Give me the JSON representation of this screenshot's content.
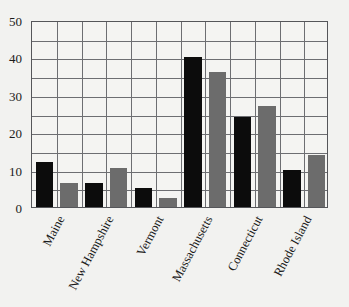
{
  "chart_data": {
    "type": "bar",
    "title": "",
    "subtitle": "",
    "xlabel": "",
    "ylabel": "",
    "categories": [
      "Maine",
      "New Hampshire",
      "Vermont",
      "Massachusetts",
      "Connecticut",
      "Rhode Island"
    ],
    "series": [
      {
        "name": "Series 1",
        "color": "#0c0c0c",
        "values": [
          12,
          6.5,
          5,
          40,
          24,
          10
        ]
      },
      {
        "name": "Series 2",
        "color": "#6c6c6c",
        "values": [
          6.5,
          10.5,
          2.5,
          36,
          27,
          14
        ]
      }
    ],
    "ylim": [
      0,
      50
    ],
    "ytick_labels": [
      "0",
      "10",
      "20",
      "30",
      "40",
      "50"
    ],
    "ytick_values": [
      0,
      10,
      20,
      30,
      40,
      50
    ],
    "gridlines_major_y": [
      0,
      5,
      10,
      15,
      20,
      25,
      30,
      35,
      40,
      45,
      50
    ],
    "grid": true,
    "legend": "none",
    "legend_position": "none",
    "annotations": [],
    "background_color": "#f2f2f0",
    "plot_background_color": "#f4f4f2",
    "grid_color": "#6d6e72",
    "axis_color": "#55565a"
  }
}
